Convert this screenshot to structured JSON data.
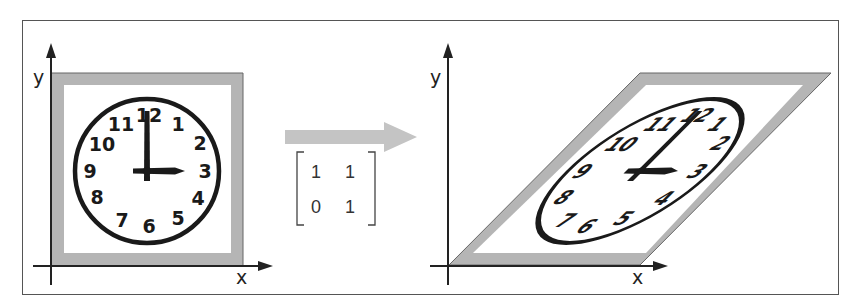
{
  "figure": {
    "left_panel": {
      "axis_x_label": "x",
      "axis_y_label": "y",
      "clock_numbers": [
        "12",
        "1",
        "2",
        "3",
        "4",
        "5",
        "6",
        "7",
        "8",
        "9",
        "10",
        "11"
      ],
      "time_shown": "3:00"
    },
    "transform": {
      "matrix": [
        [
          "1",
          "1"
        ],
        [
          "0",
          "1"
        ]
      ],
      "description": "shear transformation"
    },
    "right_panel": {
      "axis_x_label": "x",
      "axis_y_label": "y",
      "clock_numbers": [
        "12",
        "1",
        "2",
        "3",
        "4",
        "5",
        "6",
        "7",
        "8",
        "9",
        "10",
        "11"
      ]
    },
    "colors": {
      "frame_border": "#555555",
      "shape_fill_border": "#b5b5b5",
      "arrow": "#c4c4c4",
      "ink": "#1a1a1a"
    }
  }
}
